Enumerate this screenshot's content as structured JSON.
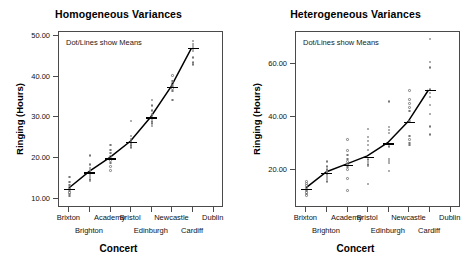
{
  "figure": {
    "panels": [
      "homogeneous",
      "heterogeneous"
    ]
  },
  "chart_data": [
    {
      "type": "scatter",
      "panel_id": "homogeneous",
      "title": "Homogeneous Variances",
      "annotation": "Dot/Lines show Means",
      "xlabel": "Concert",
      "ylabel": "Ringing (Hours)",
      "categories": [
        "Brixton",
        "Brighton",
        "Academy",
        "Bristol",
        "Edinburgh",
        "Newcastle",
        "Cardiff",
        "Dublin"
      ],
      "xlabel_rows": [
        {
          "row": 0,
          "labels": [
            {
              "text": "Brixton",
              "index": 0
            },
            {
              "text": "Academy",
              "index": 2
            },
            {
              "text": "Bristol",
              "index": 3
            },
            {
              "text": "Newcastle",
              "index": 5
            },
            {
              "text": "Dublin",
              "index": 7
            }
          ]
        },
        {
          "row": 1,
          "labels": [
            {
              "text": "Brighton",
              "index": 1
            },
            {
              "text": "Edinburgh",
              "index": 4
            },
            {
              "text": "Cardiff",
              "index": 6
            }
          ]
        }
      ],
      "ylim": [
        8.0,
        51.0
      ],
      "yticks": [
        10.0,
        20.0,
        30.0,
        40.0,
        50.0
      ],
      "ytick_labels": [
        "10.00",
        "20.00",
        "30.00",
        "40.00",
        "50.00"
      ],
      "grid": false,
      "legend": "none",
      "means": [
        12.5,
        16.6,
        20.0,
        24.0,
        30.0,
        37.5,
        47.0
      ],
      "mean_x_index": [
        0,
        1,
        2,
        3,
        4,
        5,
        6
      ],
      "series": [
        {
          "name": "Brixton",
          "x_index": 0,
          "values": [
            15.6,
            14.4,
            13.6,
            13.0,
            12.6,
            12.2,
            11.8,
            11.4,
            10.9
          ]
        },
        {
          "name": "Brighton",
          "x_index": 1,
          "values": [
            20.8,
            18.6,
            17.8,
            17.2,
            16.6,
            16.1,
            15.6,
            15.0,
            14.6
          ]
        },
        {
          "name": "Academy",
          "x_index": 2,
          "values": [
            23.4,
            22.2,
            21.4,
            20.6,
            20.0,
            19.6,
            19.0,
            18.2,
            17.2
          ]
        },
        {
          "name": "Bristol",
          "x_index": 3,
          "values": [
            29.3,
            25.6,
            24.9,
            24.4,
            24.0,
            23.6,
            23.2,
            22.8
          ]
        },
        {
          "name": "Edinburgh",
          "x_index": 4,
          "values": [
            34.4,
            33.0,
            31.8,
            30.8,
            30.2,
            29.8,
            29.2,
            28.6,
            28.0
          ]
        },
        {
          "name": "Newcastle",
          "x_index": 5,
          "values": [
            40.3,
            39.0,
            38.4,
            37.8,
            37.2,
            36.6,
            34.4
          ]
        },
        {
          "name": "Dublin",
          "x_index": 6,
          "values": [
            48.8,
            48.1,
            47.6,
            47.0,
            46.4,
            44.8,
            43.6,
            43.0
          ]
        }
      ]
    },
    {
      "type": "scatter",
      "panel_id": "heterogeneous",
      "title": "Heterogeneous Variances",
      "annotation": "Dot/Lines show Means",
      "xlabel": "Concert",
      "ylabel": "Ringing (Hours)",
      "categories": [
        "Brixton",
        "Brighton",
        "Academy",
        "Bristol",
        "Edinburgh",
        "Newcastle",
        "Cardiff",
        "Dublin"
      ],
      "xlabel_rows": [
        {
          "row": 0,
          "labels": [
            {
              "text": "Brixton",
              "index": 0
            },
            {
              "text": "Academy",
              "index": 2
            },
            {
              "text": "Bristol",
              "index": 3
            },
            {
              "text": "Newcastle",
              "index": 5
            },
            {
              "text": "Dublin",
              "index": 7
            }
          ]
        },
        {
          "row": 1,
          "labels": [
            {
              "text": "Brighton",
              "index": 1
            },
            {
              "text": "Edinburgh",
              "index": 4
            },
            {
              "text": "Cardiff",
              "index": 6
            }
          ]
        }
      ],
      "ylim": [
        6.0,
        72.0
      ],
      "yticks": [
        20.0,
        40.0,
        60.0
      ],
      "ytick_labels": [
        "20.00",
        "40.00",
        "60.00"
      ],
      "grid": false,
      "legend": "none",
      "means": [
        13.0,
        19.0,
        22.0,
        25.0,
        30.0,
        38.0,
        50.0
      ],
      "mean_x_index": [
        0,
        1,
        2,
        3,
        4,
        5,
        6
      ],
      "series": [
        {
          "name": "Brixton",
          "x_index": 0,
          "values": [
            16.0,
            15.2,
            14.4,
            13.6,
            13.0,
            12.4,
            11.8,
            11.2,
            10.6
          ]
        },
        {
          "name": "Brighton",
          "x_index": 1,
          "values": [
            23.4,
            21.6,
            20.4,
            19.6,
            19.0,
            18.4,
            17.6,
            16.8,
            16.0
          ]
        },
        {
          "name": "Academy",
          "x_index": 2,
          "values": [
            31.6,
            27.6,
            25.8,
            24.4,
            23.4,
            22.4,
            21.4,
            20.4,
            17.0,
            12.6
          ]
        },
        {
          "name": "Bristol",
          "x_index": 3,
          "values": [
            35.6,
            32.6,
            31.2,
            29.6,
            27.8,
            24.2,
            23.2,
            22.4,
            21.8,
            15.0
          ]
        },
        {
          "name": "Edinburgh",
          "x_index": 4,
          "values": [
            46.0,
            36.4,
            35.2,
            34.2,
            30.0,
            29.0,
            24.4,
            23.6,
            22.8,
            19.8
          ]
        },
        {
          "name": "Newcastle",
          "x_index": 5,
          "values": [
            50.0,
            46.6,
            45.2,
            43.6,
            42.4,
            38.6,
            33.0,
            31.6,
            30.4,
            29.6
          ]
        },
        {
          "name": "Dublin",
          "x_index": 6,
          "values": [
            69.4,
            60.8,
            58.6,
            50.4,
            49.2,
            47.6,
            44.6,
            41.2,
            36.6,
            33.6
          ]
        }
      ]
    }
  ]
}
